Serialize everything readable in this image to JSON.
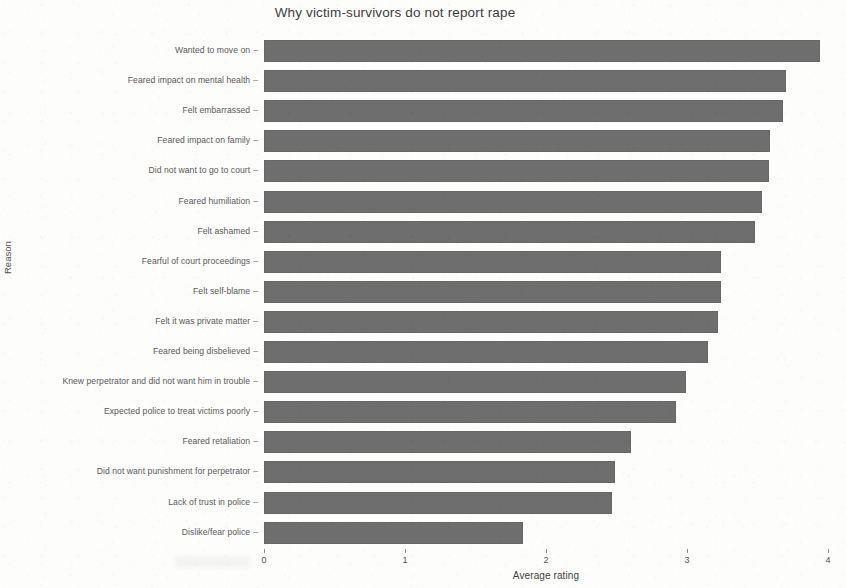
{
  "chart_data": {
    "type": "bar",
    "orientation": "horizontal",
    "title": "Why victim-survivors do not report rape",
    "xlabel": "Average rating",
    "ylabel": "Reason",
    "xlim": [
      0,
      4
    ],
    "xticks": [
      0,
      1,
      2,
      3,
      4
    ],
    "xtick_labels": [
      "0",
      "1",
      "2",
      "3",
      "4"
    ],
    "grid": false,
    "legend": null,
    "bar_color": "#6e6e6e",
    "background_color": "#fdfdfc",
    "categories": [
      "Wanted to move on",
      "Feared impact on mental health",
      "Felt embarrassed",
      "Feared impact on family",
      "Did not want to go to court",
      "Feared humiliation",
      "Felt ashamed",
      "Fearful of court proceedings",
      "Felt self-blame",
      "Felt it was private matter",
      "Feared being disbelieved",
      "Knew perpetrator and did not want him in trouble",
      "Expected police to treat victims poorly",
      "Feared retaliation",
      "Did not want punishment for perpetrator",
      "Lack of trust in police",
      "Dislike/fear police"
    ],
    "values": [
      3.94,
      3.7,
      3.68,
      3.59,
      3.58,
      3.53,
      3.48,
      3.24,
      3.24,
      3.22,
      3.15,
      2.99,
      2.92,
      2.6,
      2.49,
      2.47,
      1.84
    ]
  },
  "axis": {
    "y_title": "Reason",
    "x_title": "Average rating"
  }
}
